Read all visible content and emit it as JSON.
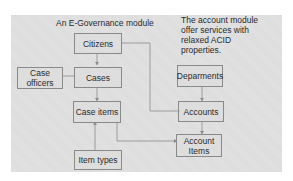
{
  "diagram": {
    "title": "An E-Governance module",
    "note": "The account module offer services with relaxed ACID properties.",
    "nodes": {
      "citizens": "Citizens",
      "case_officers_line1": "Case",
      "case_officers_line2": "officers",
      "cases": "Cases",
      "case_items": "Case items",
      "item_types": "Item types",
      "departments": "Deparments",
      "accounts": "Accounts",
      "account_items_line1": "Account",
      "account_items_line2": "Items"
    },
    "edges": [
      {
        "from": "Citizens",
        "to": "Cases"
      },
      {
        "from": "Case officers",
        "to": "Cases"
      },
      {
        "from": "Cases",
        "to": "Case items"
      },
      {
        "from": "Item types",
        "to": "Case items"
      },
      {
        "from": "Citizens",
        "to": "Accounts"
      },
      {
        "from": "Departments",
        "to": "Accounts"
      },
      {
        "from": "Accounts",
        "to": "Account Items"
      },
      {
        "from": "Case items",
        "to": "Account Items"
      }
    ],
    "colors": {
      "panel": "#dcdcdc",
      "border": "#8a8a8a",
      "text": "#2a2a2a"
    }
  }
}
